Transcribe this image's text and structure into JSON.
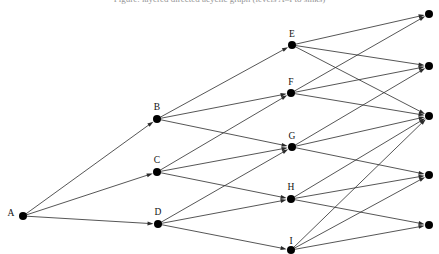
{
  "figure": {
    "title_clipped": "Figure: layered directed acyclic graph (levels A–I to sinks)",
    "background_color": "#ffffff",
    "edge_color": "#2b2b2b",
    "node_color": "#000000",
    "node_radius": 4.0,
    "edge_width": 0.8,
    "arrowhead_length": 6,
    "arrowhead_width": 4
  },
  "chart_data": {
    "type": "diagram",
    "title": "",
    "layout": "left-to-right layered digraph",
    "nodes": [
      {
        "id": "A",
        "label": "A",
        "x": 23,
        "y": 216,
        "label_x": 11,
        "label_y": 218,
        "layer": 0,
        "labeled": true
      },
      {
        "id": "B",
        "label": "B",
        "x": 157,
        "y": 119,
        "label_x": 157,
        "label_y": 112,
        "layer": 1,
        "labeled": true
      },
      {
        "id": "C",
        "label": "C",
        "x": 157,
        "y": 172,
        "label_x": 157,
        "label_y": 165,
        "layer": 1,
        "labeled": true
      },
      {
        "id": "D",
        "label": "D",
        "x": 158,
        "y": 224,
        "label_x": 158,
        "label_y": 217,
        "layer": 1,
        "labeled": true
      },
      {
        "id": "E",
        "label": "E",
        "x": 292,
        "y": 45,
        "label_x": 292,
        "label_y": 39,
        "layer": 2,
        "labeled": true
      },
      {
        "id": "F",
        "label": "F",
        "x": 291,
        "y": 93,
        "label_x": 291,
        "label_y": 87,
        "layer": 2,
        "labeled": true
      },
      {
        "id": "G",
        "label": "G",
        "x": 292,
        "y": 147,
        "label_x": 292,
        "label_y": 141,
        "layer": 2,
        "labeled": true
      },
      {
        "id": "H",
        "label": "H",
        "x": 291,
        "y": 199,
        "label_x": 291,
        "label_y": 192,
        "layer": 2,
        "labeled": true
      },
      {
        "id": "I",
        "label": "I",
        "x": 291,
        "y": 250,
        "label_x": 291,
        "label_y": 246,
        "layer": 2,
        "labeled": true
      },
      {
        "id": "J",
        "label": "",
        "x": 429,
        "y": 14,
        "label_x": 0,
        "label_y": 0,
        "layer": 3,
        "labeled": false
      },
      {
        "id": "K",
        "label": "",
        "x": 429,
        "y": 66,
        "label_x": 0,
        "label_y": 0,
        "layer": 3,
        "labeled": false
      },
      {
        "id": "L",
        "label": "",
        "x": 429,
        "y": 116,
        "label_x": 0,
        "label_y": 0,
        "layer": 3,
        "labeled": false
      },
      {
        "id": "M",
        "label": "",
        "x": 429,
        "y": 175,
        "label_x": 0,
        "label_y": 0,
        "layer": 3,
        "labeled": false
      },
      {
        "id": "N",
        "label": "",
        "x": 429,
        "y": 225,
        "label_x": 0,
        "label_y": 0,
        "layer": 3,
        "labeled": false
      }
    ],
    "edges": [
      {
        "from": "A",
        "to": "B",
        "directed": true
      },
      {
        "from": "A",
        "to": "C",
        "directed": true
      },
      {
        "from": "A",
        "to": "D",
        "directed": true
      },
      {
        "from": "B",
        "to": "E",
        "directed": true
      },
      {
        "from": "B",
        "to": "F",
        "directed": true
      },
      {
        "from": "B",
        "to": "G",
        "directed": true
      },
      {
        "from": "C",
        "to": "F",
        "directed": true
      },
      {
        "from": "C",
        "to": "G",
        "directed": true
      },
      {
        "from": "C",
        "to": "H",
        "directed": true
      },
      {
        "from": "D",
        "to": "G",
        "directed": true
      },
      {
        "from": "D",
        "to": "H",
        "directed": true
      },
      {
        "from": "D",
        "to": "I",
        "directed": true
      },
      {
        "from": "E",
        "to": "J",
        "directed": true
      },
      {
        "from": "E",
        "to": "K",
        "directed": true
      },
      {
        "from": "E",
        "to": "L",
        "directed": true
      },
      {
        "from": "F",
        "to": "J",
        "directed": true
      },
      {
        "from": "F",
        "to": "K",
        "directed": true
      },
      {
        "from": "F",
        "to": "L",
        "directed": true
      },
      {
        "from": "G",
        "to": "K",
        "directed": true
      },
      {
        "from": "G",
        "to": "L",
        "directed": true
      },
      {
        "from": "G",
        "to": "M",
        "directed": true
      },
      {
        "from": "H",
        "to": "L",
        "directed": true
      },
      {
        "from": "H",
        "to": "M",
        "directed": true
      },
      {
        "from": "H",
        "to": "N",
        "directed": true
      },
      {
        "from": "I",
        "to": "L",
        "directed": true
      },
      {
        "from": "I",
        "to": "M",
        "directed": true
      },
      {
        "from": "I",
        "to": "N",
        "directed": true
      }
    ],
    "node_count": 14,
    "edge_count": 27,
    "layer_sizes": [
      1,
      3,
      5,
      5
    ]
  }
}
